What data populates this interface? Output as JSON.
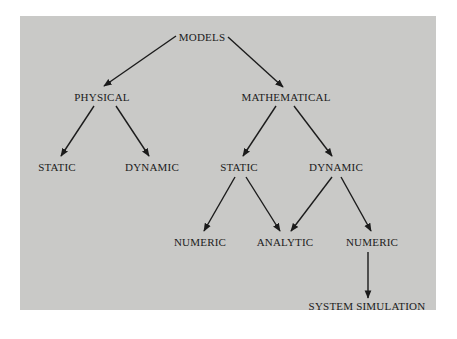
{
  "diagram": {
    "type": "tree",
    "background_color": "#c9c9c7",
    "text_color": "#1b1b1b",
    "nodes": {
      "models": {
        "label": "MODELS",
        "x": 202,
        "y": 31
      },
      "physical": {
        "label": "PHYSICAL",
        "x": 102,
        "y": 91
      },
      "mathematical": {
        "label": "MATHEMATICAL",
        "x": 286,
        "y": 91
      },
      "phys_static": {
        "label": "STATIC",
        "x": 57,
        "y": 161
      },
      "phys_dynamic": {
        "label": "DYNAMIC",
        "x": 152,
        "y": 161
      },
      "math_static": {
        "label": "STATIC",
        "x": 239,
        "y": 161
      },
      "math_dynamic": {
        "label": "DYNAMIC",
        "x": 336,
        "y": 161
      },
      "numeric_1": {
        "label": "NUMERIC",
        "x": 200,
        "y": 236
      },
      "analytic": {
        "label": "ANALYTIC",
        "x": 285,
        "y": 236
      },
      "numeric_2": {
        "label": "NUMERIC",
        "x": 372,
        "y": 236
      },
      "system_simulation": {
        "label": "SYSTEM SIMULATION",
        "x": 367,
        "y": 301
      }
    },
    "edges": [
      {
        "from": "models",
        "to": "physical"
      },
      {
        "from": "models",
        "to": "mathematical"
      },
      {
        "from": "physical",
        "to": "phys_static"
      },
      {
        "from": "physical",
        "to": "phys_dynamic"
      },
      {
        "from": "mathematical",
        "to": "math_static"
      },
      {
        "from": "mathematical",
        "to": "math_dynamic"
      },
      {
        "from": "math_static",
        "to": "numeric_1"
      },
      {
        "from": "math_static",
        "to": "analytic"
      },
      {
        "from": "math_dynamic",
        "to": "analytic"
      },
      {
        "from": "math_dynamic",
        "to": "numeric_2"
      },
      {
        "from": "numeric_2",
        "to": "system_simulation"
      }
    ]
  }
}
